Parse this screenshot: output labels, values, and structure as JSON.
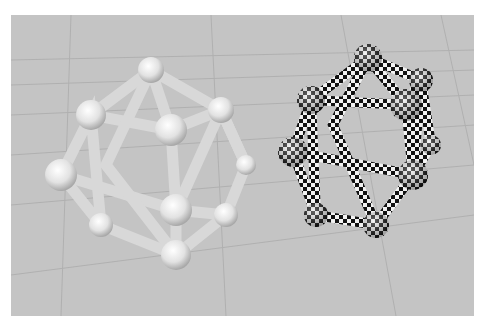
{
  "scene": {
    "description": "3D render of two icosahedron ball-and-stick models on a grey grid floor",
    "background_color": "#c4c4c4",
    "grid_color": "#b2b2b2",
    "objects": [
      {
        "name": "plain-icosahedron",
        "material": "matte light grey",
        "color": "#e0e0e0"
      },
      {
        "name": "checkered-icosahedron",
        "material": "black and white checker",
        "colors": [
          "#111111",
          "#f2f2f2"
        ]
      }
    ]
  }
}
